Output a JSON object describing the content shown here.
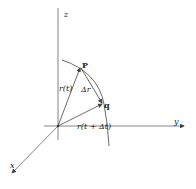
{
  "diagram": {
    "axes": {
      "z_label": "z",
      "y_label": "y",
      "x_label": "x"
    },
    "points": {
      "p_label": "P",
      "q_label": "q"
    },
    "vectors": {
      "r_t": "r(t)",
      "r_t_dt": "r(t + Δt)",
      "delta_r": "Δr"
    },
    "colors": {
      "line": "#444444",
      "axis": "#666666",
      "background": "#ffffff"
    }
  }
}
